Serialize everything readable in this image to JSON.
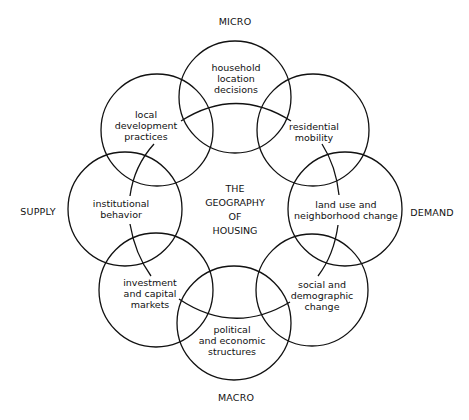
{
  "title": {
    "lines": [
      "THE",
      "GEOGRAPHY",
      "OF",
      "HOUSING"
    ]
  },
  "axes": {
    "top": "MICRO",
    "bottom": "MACRO",
    "left": "SUPPLY",
    "right": "DEMAND"
  },
  "circles": [
    {
      "id": "household",
      "lines": [
        "household",
        "location",
        "decisions"
      ],
      "cx": 235,
      "cy": 97,
      "r": 56
    },
    {
      "id": "residential",
      "lines": [
        "residential",
        "mobility"
      ],
      "cx": 313,
      "cy": 130,
      "r": 56
    },
    {
      "id": "landuse",
      "lines": [
        "land use and",
        "neighborhood change"
      ],
      "cx": 345,
      "cy": 209,
      "r": 57
    },
    {
      "id": "social",
      "lines": [
        "social and",
        "demographic",
        "change"
      ],
      "cx": 312,
      "cy": 290,
      "r": 56
    },
    {
      "id": "political",
      "lines": [
        "political",
        "and economic",
        "structures"
      ],
      "cx": 234,
      "cy": 323,
      "r": 57
    },
    {
      "id": "investment",
      "lines": [
        "investment",
        "and capital",
        "markets"
      ],
      "cx": 156,
      "cy": 290,
      "r": 57
    },
    {
      "id": "institutional",
      "lines": [
        "institutional",
        "behavior"
      ],
      "cx": 125,
      "cy": 209,
      "r": 57
    },
    {
      "id": "local",
      "lines": [
        "local",
        "development",
        "practices"
      ],
      "cx": 157,
      "cy": 130,
      "r": 56
    }
  ],
  "style": {
    "stroke_color": "#111111",
    "background": "#ffffff"
  }
}
